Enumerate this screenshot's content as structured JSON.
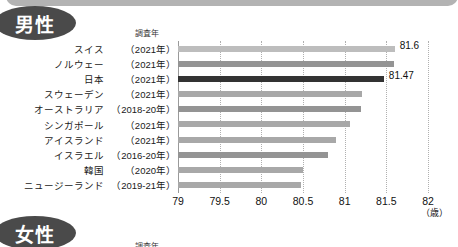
{
  "top_band": {
    "color": "#b3b3b3"
  },
  "sections": {
    "male": {
      "badge_label": "男性",
      "year_header": "調査年"
    },
    "female": {
      "badge_label": "女性",
      "year_header": "調査年"
    }
  },
  "axis": {
    "ticks": [
      "79",
      "79.5",
      "80",
      "80.5",
      "81",
      "81.5",
      "82"
    ],
    "tick_values": [
      79,
      79.5,
      80,
      80.5,
      81,
      81.5,
      82
    ],
    "unit_label": "（歳）",
    "min": 79,
    "max": 82
  },
  "colors": {
    "badge": "#4a4a4a",
    "bar_default": "#a8a8a8",
    "bar_highlight": "#333333",
    "gridline": "#b0b0b0"
  },
  "chart_data": {
    "type": "bar",
    "orientation": "horizontal",
    "title": "男性",
    "xlabel": "（歳）",
    "ylabel": "",
    "xlim": [
      79,
      82
    ],
    "grid": true,
    "legend": null,
    "columns": [
      "国名",
      "調査年",
      "平均寿命"
    ],
    "categories": [
      "スイス",
      "ノルウェー",
      "日本",
      "スウェーデン",
      "オーストラリア",
      "シンガポール",
      "アイスランド",
      "イスラエル",
      "韓国",
      "ニュージーランド"
    ],
    "survey_years": [
      "（2021年）",
      "（2021年）",
      "（2021年）",
      "（2021年）",
      "（2018-20年）",
      "（2021年）",
      "（2021年）",
      "（2016-20年）",
      "（2020年）",
      "（2019-21年）"
    ],
    "values": [
      81.6,
      81.59,
      81.47,
      81.21,
      81.19,
      81.06,
      80.89,
      80.8,
      80.5,
      80.48
    ],
    "value_labels": [
      "81.6",
      "",
      "81.47",
      "",
      "",
      "",
      "",
      "",
      "",
      ""
    ],
    "highlight_index": 2,
    "shade_variants": [
      "lighter",
      "darker",
      "highlight",
      "",
      "darker",
      "",
      "",
      "darker",
      "",
      ""
    ]
  }
}
